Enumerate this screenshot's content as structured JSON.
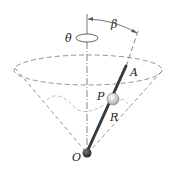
{
  "diagram": {
    "type": "physics-mechanics",
    "labels": {
      "theta_dot": "θ̇",
      "beta": "β",
      "A": "A",
      "P": "P",
      "R": "R",
      "O": "O"
    },
    "colors": {
      "line": "#555555",
      "dashed": "#777777",
      "rod": "#3a3a3a",
      "ball_P": "#d8d8d8",
      "ball_O": "#333333",
      "path": "#bbbbbb"
    }
  }
}
